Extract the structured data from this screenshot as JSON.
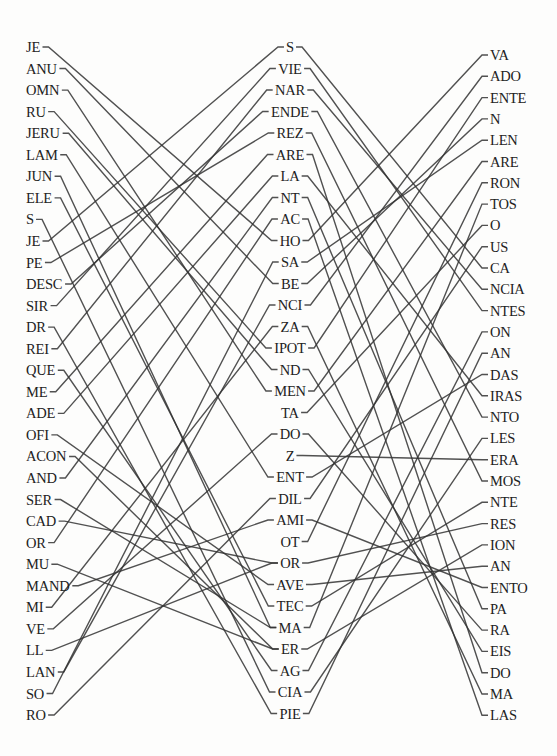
{
  "diagram": {
    "type": "three-column syllable matching puzzle",
    "left_column": [
      "JE",
      "ANU",
      "OMN",
      "RU",
      "JERU",
      "LAM",
      "JUN",
      "ELE",
      "S",
      "JE",
      "PE",
      "DESC",
      "SIR",
      "DR",
      "REI",
      "QUE",
      "ME",
      "ADE",
      "OFI",
      "ACON",
      "AND",
      "SER",
      "CAD",
      "OR",
      "MU",
      "MAND",
      "MI",
      "VE",
      "LL",
      "LAN",
      "SO",
      "RO"
    ],
    "middle_column": [
      "S",
      "VIE",
      "NAR",
      "ENDE",
      "REZ",
      "ARE",
      "LA",
      "NT",
      "AC",
      "HO",
      "SA",
      "BE",
      "NCI",
      "ZA",
      "IPOT",
      "ND",
      "MEN",
      "TA",
      "DO",
      "Z",
      "ENT",
      "DIL",
      "AMI",
      "OT",
      "OR",
      "AVE",
      "TEC",
      "MA",
      "ER",
      "AG",
      "CIA",
      "PIE"
    ],
    "right_column": [
      "VA",
      "ADO",
      "ENTE",
      "N",
      "LEN",
      "ARE",
      "RON",
      "TOS",
      "O",
      "US",
      "CA",
      "NCIA",
      "NTES",
      "ON",
      "AN",
      "DAS",
      "IRAS",
      "NTO",
      "LES",
      "ERA",
      "MOS",
      "NTE",
      "RES",
      "ION",
      "AN",
      "ENTO",
      "PA",
      "RA",
      "EIS",
      "DO",
      "MA",
      "LAS"
    ],
    "left_to_middle": [
      [
        0,
        9
      ],
      [
        1,
        11
      ],
      [
        2,
        16
      ],
      [
        3,
        14
      ],
      [
        4,
        15
      ],
      [
        5,
        20
      ],
      [
        6,
        27
      ],
      [
        7,
        26
      ],
      [
        8,
        30
      ],
      [
        9,
        0
      ],
      [
        10,
        4
      ],
      [
        11,
        3
      ],
      [
        12,
        1
      ],
      [
        13,
        31
      ],
      [
        14,
        2
      ],
      [
        15,
        29
      ],
      [
        16,
        5
      ],
      [
        17,
        6
      ],
      [
        18,
        25
      ],
      [
        19,
        28
      ],
      [
        20,
        7
      ],
      [
        21,
        27
      ],
      [
        22,
        24
      ],
      [
        23,
        8
      ],
      [
        24,
        28
      ],
      [
        25,
        22
      ],
      [
        26,
        13
      ],
      [
        27,
        18
      ],
      [
        28,
        24
      ],
      [
        29,
        12
      ],
      [
        30,
        10
      ],
      [
        31,
        21
      ]
    ],
    "middle_to_right": [
      [
        0,
        10
      ],
      [
        1,
        12
      ],
      [
        2,
        11
      ],
      [
        3,
        17
      ],
      [
        4,
        20
      ],
      [
        5,
        29
      ],
      [
        6,
        16
      ],
      [
        7,
        26
      ],
      [
        8,
        31
      ],
      [
        9,
        0
      ],
      [
        10,
        4
      ],
      [
        11,
        3
      ],
      [
        12,
        1
      ],
      [
        13,
        30
      ],
      [
        14,
        2
      ],
      [
        15,
        28
      ],
      [
        16,
        5
      ],
      [
        17,
        8
      ],
      [
        18,
        27
      ],
      [
        19,
        19
      ],
      [
        20,
        15
      ],
      [
        21,
        9
      ],
      [
        22,
        25
      ],
      [
        23,
        6
      ],
      [
        24,
        22
      ],
      [
        25,
        24
      ],
      [
        26,
        21
      ],
      [
        27,
        7
      ],
      [
        28,
        23
      ],
      [
        29,
        13
      ],
      [
        30,
        18
      ],
      [
        31,
        14
      ]
    ],
    "line_color": "#333333"
  }
}
